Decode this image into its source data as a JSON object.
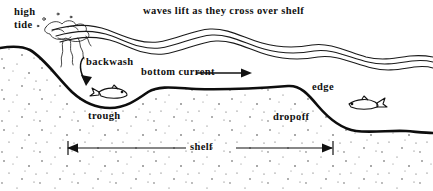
{
  "figure": {
    "background_color": "#ffffff",
    "ink_color": "#111111",
    "width": 433,
    "height": 191
  },
  "labels": {
    "high": "high",
    "tide": "tide",
    "waves": "waves lift as they cross over shelf",
    "backwash": "backwash",
    "bottom_current": "bottom current",
    "edge": "edge",
    "trough": "trough",
    "dropoff": "dropoff",
    "shelf": "shelf"
  },
  "icons": {
    "backwash_arrow": "curved-down-arrow-icon",
    "bottom_current_arrow": "right-arrow-icon",
    "shelf_extent_arrow": "double-headed-arrow-icon",
    "fish_left": "fish-icon",
    "fish_right": "fish-icon",
    "surf_foam": "foam-icon",
    "sand_stipple": "stipple-texture-icon"
  },
  "features": {
    "water_surface_lines": 3,
    "seafloor_profile": "beach slope, trough, flat shelf, dropoff, deep floor",
    "shelf_span_px": [
      68,
      332
    ]
  }
}
